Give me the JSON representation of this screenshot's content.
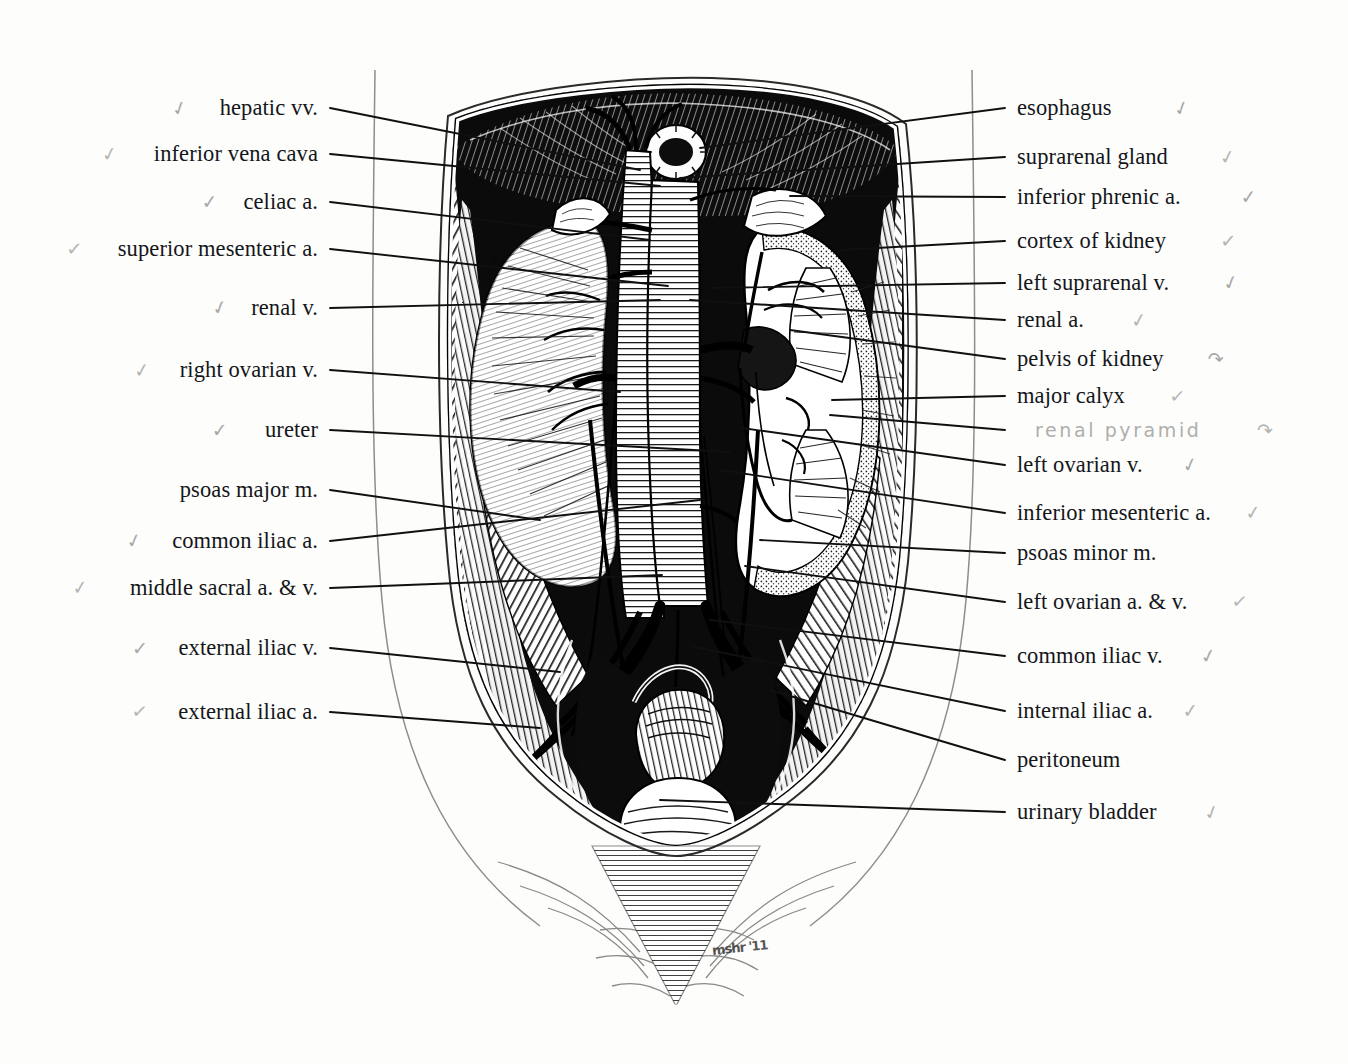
{
  "plate": {
    "title": "Posterior abdominal wall — retroperitoneal viscera and great vessels",
    "signature": "mshr '11",
    "ink_color": "#14161a",
    "pencil_color": "#aeafac",
    "paper_color": "#fdfdfc"
  },
  "annotations": {
    "handwritten": [
      {
        "text": "renal pyramid",
        "tick": "↷"
      }
    ]
  },
  "labels_left": [
    {
      "text": "hepatic vv.",
      "tick": "✓"
    },
    {
      "text": "inferior vena cava",
      "tick": "✓"
    },
    {
      "text": "celiac a.",
      "tick": "✓"
    },
    {
      "text": "superior mesenteric a.",
      "tick": "✓"
    },
    {
      "text": "renal v.",
      "tick": "✓"
    },
    {
      "text": "right ovarian v.",
      "tick": "✓"
    },
    {
      "text": "ureter",
      "tick": "✓"
    },
    {
      "text": "psoas major m.",
      "tick": ""
    },
    {
      "text": "common iliac a.",
      "tick": "✓"
    },
    {
      "text": "middle sacral a. & v.",
      "tick": "✓"
    },
    {
      "text": "external iliac v.",
      "tick": "✓"
    },
    {
      "text": "external iliac a.",
      "tick": "✓"
    }
  ],
  "labels_right": [
    {
      "text": "esophagus",
      "tick": "✓"
    },
    {
      "text": "suprarenal gland",
      "tick": "✓"
    },
    {
      "text": "inferior phrenic a.",
      "tick": "✓"
    },
    {
      "text": "cortex of kidney",
      "tick": "✓"
    },
    {
      "text": "left suprarenal v.",
      "tick": "✓"
    },
    {
      "text": "renal a.",
      "tick": "✓"
    },
    {
      "text": "pelvis of kidney",
      "tick": "↷"
    },
    {
      "text": "major calyx",
      "tick": "✓"
    },
    {
      "text": "left ovarian v.",
      "tick": "✓"
    },
    {
      "text": "inferior mesenteric a.",
      "tick": "✓"
    },
    {
      "text": "psoas minor m.",
      "tick": ""
    },
    {
      "text": "left ovarian a. & v.",
      "tick": "✓"
    },
    {
      "text": "common iliac v.",
      "tick": "✓"
    },
    {
      "text": "internal iliac a.",
      "tick": "✓"
    },
    {
      "text": "peritoneum",
      "tick": ""
    },
    {
      "text": "urinary bladder",
      "tick": "✓"
    }
  ],
  "layout": {
    "labels_left_geometry": [
      {
        "x": 318,
        "y": 108,
        "tick_x": 180,
        "lx1": 330,
        "ly1": 108,
        "lx2": 640,
        "ly2": 170
      },
      {
        "x": 318,
        "y": 154,
        "tick_x": 110,
        "lx1": 330,
        "ly1": 154,
        "lx2": 660,
        "ly2": 186
      },
      {
        "x": 318,
        "y": 202,
        "tick_x": 210,
        "lx1": 330,
        "ly1": 202,
        "lx2": 650,
        "ly2": 240
      },
      {
        "x": 318,
        "y": 249,
        "tick_x": 74,
        "lx1": 330,
        "ly1": 249,
        "lx2": 668,
        "ly2": 286
      },
      {
        "x": 318,
        "y": 308,
        "tick_x": 220,
        "lx1": 330,
        "ly1": 308,
        "lx2": 660,
        "ly2": 300
      },
      {
        "x": 318,
        "y": 370,
        "tick_x": 142,
        "lx1": 330,
        "ly1": 370,
        "lx2": 620,
        "ly2": 392
      },
      {
        "x": 318,
        "y": 430,
        "tick_x": 220,
        "lx1": 330,
        "ly1": 430,
        "lx2": 730,
        "ly2": 452
      },
      {
        "x": 318,
        "y": 490,
        "tick_x": 140,
        "lx1": 330,
        "ly1": 490,
        "lx2": 540,
        "ly2": 520
      },
      {
        "x": 318,
        "y": 541,
        "tick_x": 134,
        "lx1": 330,
        "ly1": 541,
        "lx2": 700,
        "ly2": 500
      },
      {
        "x": 318,
        "y": 588,
        "tick_x": 80,
        "lx1": 330,
        "ly1": 588,
        "lx2": 662,
        "ly2": 575
      },
      {
        "x": 318,
        "y": 648,
        "tick_x": 140,
        "lx1": 330,
        "ly1": 648,
        "lx2": 560,
        "ly2": 672
      },
      {
        "x": 318,
        "y": 712,
        "tick_x": 140,
        "lx1": 330,
        "ly1": 712,
        "lx2": 540,
        "ly2": 728
      }
    ],
    "labels_right_geometry": [
      {
        "x": 1017,
        "y": 108,
        "tick_x": 1182,
        "lx1": 1005,
        "ly1": 108,
        "lx2": 700,
        "ly2": 148
      },
      {
        "x": 1017,
        "y": 157,
        "tick_x": 1228,
        "lx1": 1005,
        "ly1": 157,
        "lx2": 680,
        "ly2": 178
      },
      {
        "x": 1017,
        "y": 197,
        "tick_x": 1249,
        "lx1": 1005,
        "ly1": 197,
        "lx2": 790,
        "ly2": 196
      },
      {
        "x": 1017,
        "y": 241,
        "tick_x": 1228,
        "lx1": 1005,
        "ly1": 241,
        "lx2": 840,
        "ly2": 250
      },
      {
        "x": 1017,
        "y": 283,
        "tick_x": 1231,
        "lx1": 1005,
        "ly1": 283,
        "lx2": 710,
        "ly2": 288
      },
      {
        "x": 1017,
        "y": 320,
        "tick_x": 1139,
        "lx1": 1005,
        "ly1": 320,
        "lx2": 690,
        "ly2": 300
      },
      {
        "x": 1017,
        "y": 359,
        "tick_x": 1216,
        "lx1": 1005,
        "ly1": 359,
        "lx2": 790,
        "ly2": 330
      },
      {
        "x": 1017,
        "y": 396,
        "tick_x": 1178,
        "lx1": 1005,
        "ly1": 396,
        "lx2": 832,
        "ly2": 400
      },
      {
        "x": 1017,
        "y": 465,
        "tick_x": 1190,
        "lx1": 1005,
        "ly1": 465,
        "lx2": 742,
        "ly2": 428
      },
      {
        "x": 1017,
        "y": 513,
        "tick_x": 1253,
        "lx1": 1005,
        "ly1": 513,
        "lx2": 720,
        "ly2": 470
      },
      {
        "x": 1017,
        "y": 553,
        "tick_x": 1190,
        "lx1": 1005,
        "ly1": 553,
        "lx2": 760,
        "ly2": 540
      },
      {
        "x": 1017,
        "y": 602,
        "tick_x": 1240,
        "lx1": 1005,
        "ly1": 602,
        "lx2": 745,
        "ly2": 566
      },
      {
        "x": 1017,
        "y": 656,
        "tick_x": 1208,
        "lx1": 1005,
        "ly1": 656,
        "lx2": 710,
        "ly2": 620
      },
      {
        "x": 1017,
        "y": 711,
        "tick_x": 1190,
        "lx1": 1005,
        "ly1": 711,
        "lx2": 690,
        "ly2": 646
      },
      {
        "x": 1017,
        "y": 760,
        "tick_x": 1160,
        "lx1": 1005,
        "ly1": 760,
        "lx2": 770,
        "ly2": 690
      },
      {
        "x": 1017,
        "y": 812,
        "tick_x": 1212,
        "lx1": 1005,
        "ly1": 812,
        "lx2": 660,
        "ly2": 800
      }
    ],
    "handwritten_geometry": [
      {
        "x": 1035,
        "y": 430,
        "tick_x": 1265,
        "lx1": 1005,
        "ly1": 430,
        "lx2": 830,
        "ly2": 415
      }
    ]
  }
}
